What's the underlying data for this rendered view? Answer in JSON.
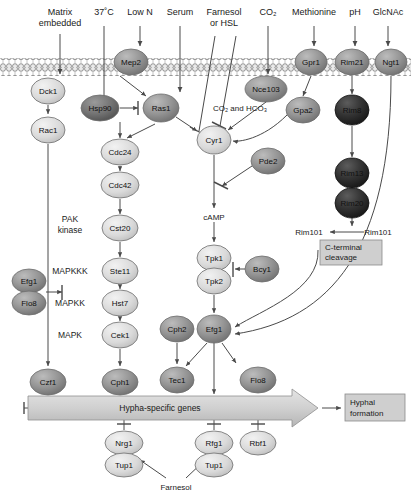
{
  "figure": {
    "type": "pathway-diagram"
  },
  "stimuli": [
    {
      "id": "matrix",
      "label_line1": "Matrix",
      "label_line2": "embedded",
      "x": 60,
      "y": 12
    },
    {
      "id": "temp",
      "label_line1": "37˚C",
      "label_line2": "",
      "x": 104,
      "y": 12
    },
    {
      "id": "lown",
      "label_line1": "Low N",
      "label_line2": "",
      "x": 140,
      "y": 12
    },
    {
      "id": "serum",
      "label_line1": "Serum",
      "label_line2": "",
      "x": 180,
      "y": 12
    },
    {
      "id": "farnesol",
      "label_line1": "Farnesol",
      "label_line2": "or HSL",
      "x": 224,
      "y": 12
    },
    {
      "id": "co2",
      "label_line1": "CO₂",
      "label_line2": "",
      "x": 268,
      "y": 12
    },
    {
      "id": "methionine",
      "label_line1": "Methionine",
      "label_line2": "",
      "x": 314,
      "y": 12
    },
    {
      "id": "ph",
      "label_line1": "pH",
      "label_line2": "",
      "x": 355,
      "y": 12
    },
    {
      "id": "glcnac",
      "label_line1": "GlcNAc",
      "label_line2": "",
      "x": 388,
      "y": 12
    }
  ],
  "membrane": {
    "top_y": 58,
    "bottom_y": 76,
    "label": "plasma-membrane"
  },
  "nodes": [
    {
      "id": "mep2",
      "label": "Mep2",
      "x": 131,
      "y": 62,
      "rx": 17,
      "ry": 13,
      "shade": "mid"
    },
    {
      "id": "gpr1",
      "label": "Gpr1",
      "x": 311,
      "y": 62,
      "rx": 16,
      "ry": 13,
      "shade": "mid"
    },
    {
      "id": "rim21",
      "label": "Rim21",
      "x": 352,
      "y": 62,
      "rx": 17,
      "ry": 13,
      "shade": "mid"
    },
    {
      "id": "ngt1",
      "label": "Ngt1",
      "x": 391,
      "y": 62,
      "rx": 16,
      "ry": 13,
      "shade": "mid"
    },
    {
      "id": "dck1",
      "label": "Dck1",
      "x": 48,
      "y": 91,
      "rx": 17,
      "ry": 13,
      "shade": "light"
    },
    {
      "id": "hsp90",
      "label": "Hsp90",
      "x": 100,
      "y": 108,
      "rx": 19,
      "ry": 13,
      "shade": "dark"
    },
    {
      "id": "ras1",
      "label": "Ras1",
      "x": 161,
      "y": 108,
      "rx": 18,
      "ry": 14,
      "shade": "mid"
    },
    {
      "id": "nce103",
      "label": "Nce103",
      "x": 266,
      "y": 89,
      "rx": 21,
      "ry": 13,
      "shade": "mid"
    },
    {
      "id": "gpa2",
      "label": "Gpa2",
      "x": 303,
      "y": 110,
      "rx": 17,
      "ry": 13,
      "shade": "mid"
    },
    {
      "id": "rim8",
      "label": "Rim8",
      "x": 352,
      "y": 110,
      "rx": 17,
      "ry": 15,
      "shade": "verydark"
    },
    {
      "id": "rac1",
      "label": "Rac1",
      "x": 48,
      "y": 130,
      "rx": 17,
      "ry": 13,
      "shade": "light"
    },
    {
      "id": "cyr1",
      "label": "Cyr1",
      "x": 214,
      "y": 140,
      "rx": 17,
      "ry": 14,
      "shade": "light"
    },
    {
      "id": "pde2",
      "label": "Pde2",
      "x": 268,
      "y": 161,
      "rx": 17,
      "ry": 13,
      "shade": "mid"
    },
    {
      "id": "rim13",
      "label": "Rim13",
      "x": 352,
      "y": 173,
      "rx": 17,
      "ry": 15,
      "shade": "verydark"
    },
    {
      "id": "cdc24",
      "label": "Cdc24",
      "x": 120,
      "y": 152,
      "rx": 19,
      "ry": 13,
      "shade": "light"
    },
    {
      "id": "cdc42",
      "label": "Cdc42",
      "x": 120,
      "y": 185,
      "rx": 19,
      "ry": 13,
      "shade": "light"
    },
    {
      "id": "rim20",
      "label": "Rim20",
      "x": 352,
      "y": 203,
      "rx": 17,
      "ry": 15,
      "shade": "verydark"
    },
    {
      "id": "cst20",
      "label": "Cst20",
      "x": 120,
      "y": 228,
      "rx": 18,
      "ry": 13,
      "shade": "light"
    },
    {
      "id": "tpk1",
      "label": "Tpk1",
      "x": 214,
      "y": 258,
      "rx": 17,
      "ry": 13,
      "shade": "light"
    },
    {
      "id": "tpk2",
      "label": "Tpk2",
      "x": 214,
      "y": 281,
      "rx": 17,
      "ry": 13,
      "shade": "light"
    },
    {
      "id": "bcy1",
      "label": "Bcy1",
      "x": 262,
      "y": 269,
      "rx": 17,
      "ry": 13,
      "shade": "mid"
    },
    {
      "id": "ste11",
      "label": "Ste11",
      "x": 120,
      "y": 271,
      "rx": 18,
      "ry": 13,
      "shade": "light"
    },
    {
      "id": "efg1-top",
      "label": "Efg1",
      "x": 29,
      "y": 281,
      "rx": 17,
      "ry": 12,
      "shade": "mid"
    },
    {
      "id": "flo8-top",
      "label": "Flo8",
      "x": 29,
      "y": 303,
      "rx": 17,
      "ry": 12,
      "shade": "mid"
    },
    {
      "id": "hst7",
      "label": "Hst7",
      "x": 120,
      "y": 303,
      "rx": 18,
      "ry": 13,
      "shade": "light"
    },
    {
      "id": "cek1",
      "label": "Cek1",
      "x": 120,
      "y": 335,
      "rx": 18,
      "ry": 13,
      "shade": "light"
    },
    {
      "id": "cph2",
      "label": "Cph2",
      "x": 177,
      "y": 329,
      "rx": 17,
      "ry": 13,
      "shade": "mid"
    },
    {
      "id": "efg1-main",
      "label": "Efg1",
      "x": 214,
      "y": 329,
      "rx": 17,
      "ry": 14,
      "shade": "mid"
    },
    {
      "id": "czf1",
      "label": "Czf1",
      "x": 48,
      "y": 382,
      "rx": 18,
      "ry": 13,
      "shade": "mid"
    },
    {
      "id": "cph1",
      "label": "Cph1",
      "x": 120,
      "y": 382,
      "rx": 18,
      "ry": 13,
      "shade": "mid"
    },
    {
      "id": "tec1",
      "label": "Tec1",
      "x": 177,
      "y": 380,
      "rx": 17,
      "ry": 13,
      "shade": "mid"
    },
    {
      "id": "flo8-bottom",
      "label": "Flo8",
      "x": 258,
      "y": 380,
      "rx": 18,
      "ry": 13,
      "shade": "mid"
    },
    {
      "id": "nrg1",
      "label": "Nrg1",
      "x": 124,
      "y": 443,
      "rx": 19,
      "ry": 12,
      "shade": "light"
    },
    {
      "id": "tup1-left",
      "label": "Tup1",
      "x": 124,
      "y": 465,
      "rx": 19,
      "ry": 12,
      "shade": "light"
    },
    {
      "id": "rfg1",
      "label": "Rfg1",
      "x": 214,
      "y": 443,
      "rx": 19,
      "ry": 12,
      "shade": "light"
    },
    {
      "id": "tup1-right",
      "label": "Tup1",
      "x": 214,
      "y": 465,
      "rx": 19,
      "ry": 12,
      "shade": "light"
    },
    {
      "id": "rbf1",
      "label": "Rbf1",
      "x": 258,
      "y": 443,
      "rx": 18,
      "ry": 12,
      "shade": "light"
    }
  ],
  "side_labels": [
    {
      "id": "pak-kinase",
      "line1": "PAK",
      "line2": "kinase",
      "x": 70,
      "y": 225
    },
    {
      "id": "mapkkk",
      "line1": "MAPKKK",
      "line2": "",
      "x": 70,
      "y": 274
    },
    {
      "id": "mapkk",
      "line1": "MAPKK",
      "line2": "",
      "x": 70,
      "y": 306
    },
    {
      "id": "mapk",
      "line1": "MAPK",
      "line2": "",
      "x": 70,
      "y": 338
    }
  ],
  "inline_labels": [
    {
      "id": "co2-hco3",
      "text": "CO₂ and HCO₃",
      "x": 213,
      "y": 108
    },
    {
      "id": "camp",
      "text": "cAMP",
      "x": 214,
      "y": 217
    },
    {
      "id": "rim101-cleaved",
      "text": "Rim101",
      "x": 309,
      "y": 232
    },
    {
      "id": "rim101-full",
      "text": "Rim101",
      "x": 378,
      "y": 232
    },
    {
      "id": "farnesol-bottom",
      "text": "Farnesol",
      "x": 170,
      "y": 487
    }
  ],
  "boxes": [
    {
      "id": "c-terminal-cleavage",
      "line1": "C-terminal",
      "line2": "cleavage",
      "x": 320,
      "y": 240,
      "w": 62,
      "h": 25
    },
    {
      "id": "hyphal-formation",
      "line1": "Hyphal",
      "line2": "formation",
      "x": 345,
      "y": 394,
      "w": 60,
      "h": 27
    }
  ],
  "gene_arrow": {
    "id": "hypha-specific-genes",
    "label": "Hypha-specific genes",
    "x": 28,
    "y": 396,
    "w": 290,
    "h": 24
  },
  "colors": {
    "light": "#d8d8d8",
    "mid": "#8d8d8d",
    "dark": "#6a6a6a",
    "verydark": "#2f2f2f",
    "membrane": "#c9c9c9",
    "box": "#c9c9c9",
    "stroke": "#4a4a4a",
    "text": "#111111"
  }
}
